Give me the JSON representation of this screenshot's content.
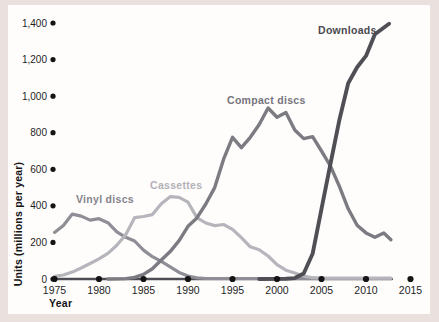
{
  "colors": {
    "frame": "#eae1df",
    "panel": "#fefdfc",
    "axis": "#4e4d53",
    "tick_dot": "#141414",
    "text": "#1f1f1f"
  },
  "chart_data": {
    "type": "line",
    "title": "",
    "xlabel": "Year",
    "ylabel": "Units (millions per year)",
    "x_range": [
      1975,
      2015
    ],
    "y_range": [
      0,
      1400
    ],
    "grid": false,
    "legend_position": "inline-labels-near-lines",
    "xticks": [
      1975,
      1980,
      1985,
      1990,
      1995,
      2000,
      2005,
      2010,
      2015
    ],
    "xtick_labels": [
      "1975",
      "1980",
      "1985",
      "1990",
      "1995",
      "2000",
      "2005",
      "2010",
      "2015"
    ],
    "yticks": [
      0,
      200,
      400,
      600,
      800,
      1000,
      1200,
      1400
    ],
    "ytick_labels": [
      "0",
      "200",
      "400",
      "600",
      "800",
      "1,000",
      "1,200",
      "1,400"
    ],
    "series": [
      {
        "name": "Vinyl discs",
        "color": "#8f8e96",
        "label_color": "#85848c",
        "points": [
          [
            1975,
            255
          ],
          [
            1976,
            292
          ],
          [
            1977,
            355
          ],
          [
            1978,
            344
          ],
          [
            1979,
            322
          ],
          [
            1980,
            330
          ],
          [
            1981,
            308
          ],
          [
            1982,
            258
          ],
          [
            1983,
            228
          ],
          [
            1984,
            208
          ],
          [
            1985,
            158
          ],
          [
            1986,
            122
          ],
          [
            1987,
            96
          ],
          [
            1988,
            66
          ],
          [
            1989,
            36
          ],
          [
            1990,
            16
          ],
          [
            1991,
            6
          ],
          [
            1992,
            3
          ],
          [
            2012.8,
            3
          ]
        ]
      },
      {
        "name": "Cassettes",
        "color": "#b6b5bb",
        "label_color": "#b2b1b7",
        "points": [
          [
            1975,
            15
          ],
          [
            1976,
            22
          ],
          [
            1977,
            38
          ],
          [
            1978,
            60
          ],
          [
            1979,
            85
          ],
          [
            1980,
            110
          ],
          [
            1981,
            140
          ],
          [
            1982,
            185
          ],
          [
            1983,
            242
          ],
          [
            1984,
            335
          ],
          [
            1985,
            342
          ],
          [
            1986,
            352
          ],
          [
            1987,
            412
          ],
          [
            1988,
            450
          ],
          [
            1989,
            446
          ],
          [
            1990,
            420
          ],
          [
            1991,
            336
          ],
          [
            1992,
            306
          ],
          [
            1993,
            292
          ],
          [
            1994,
            298
          ],
          [
            1995,
            272
          ],
          [
            1996,
            226
          ],
          [
            1997,
            176
          ],
          [
            1998,
            160
          ],
          [
            1999,
            126
          ],
          [
            2000,
            78
          ],
          [
            2001,
            48
          ],
          [
            2002,
            32
          ],
          [
            2003,
            16
          ],
          [
            2004,
            7
          ],
          [
            2005,
            5
          ],
          [
            2012.8,
            5
          ]
        ]
      },
      {
        "name": "Compact discs",
        "color": "#7c7b82",
        "label_color": "#76757c",
        "points": [
          [
            1981,
            0
          ],
          [
            1983,
            2
          ],
          [
            1984,
            9
          ],
          [
            1985,
            25
          ],
          [
            1986,
            56
          ],
          [
            1987,
            104
          ],
          [
            1988,
            150
          ],
          [
            1989,
            210
          ],
          [
            1990,
            288
          ],
          [
            1991,
            334
          ],
          [
            1992,
            410
          ],
          [
            1993,
            500
          ],
          [
            1994,
            655
          ],
          [
            1995,
            775
          ],
          [
            1996,
            718
          ],
          [
            1997,
            775
          ],
          [
            1998,
            845
          ],
          [
            1999,
            935
          ],
          [
            2000,
            885
          ],
          [
            2001,
            910
          ],
          [
            2002,
            815
          ],
          [
            2003,
            768
          ],
          [
            2004,
            778
          ],
          [
            2005,
            700
          ],
          [
            2006,
            618
          ],
          [
            2007,
            508
          ],
          [
            2008,
            384
          ],
          [
            2009,
            294
          ],
          [
            2010,
            252
          ],
          [
            2011,
            228
          ],
          [
            2012,
            252
          ],
          [
            2012.8,
            215
          ]
        ]
      },
      {
        "name": "Downloads",
        "color": "#504f56",
        "label_color": "#4a4950",
        "points": [
          [
            1998,
            0
          ],
          [
            2001,
            1
          ],
          [
            2002,
            5
          ],
          [
            2003,
            30
          ],
          [
            2004,
            138
          ],
          [
            2005,
            384
          ],
          [
            2006,
            628
          ],
          [
            2007,
            868
          ],
          [
            2008,
            1070
          ],
          [
            2009,
            1158
          ],
          [
            2010,
            1220
          ],
          [
            2011,
            1338
          ],
          [
            2012.6,
            1396
          ]
        ]
      }
    ]
  }
}
